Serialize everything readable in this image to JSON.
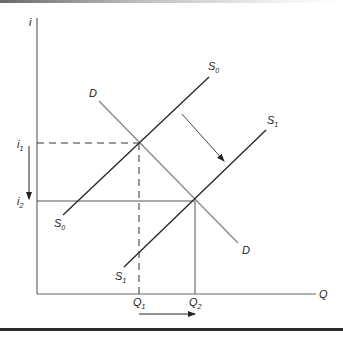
{
  "diagram": {
    "type": "supply-demand",
    "axes": {
      "y_label": "i",
      "x_label": "Q"
    },
    "curves": [
      {
        "name": "S0",
        "label": "S",
        "sub": "0",
        "kind": "supply"
      },
      {
        "name": "S1",
        "label": "S",
        "sub": "1",
        "kind": "supply"
      },
      {
        "name": "D",
        "label": "D",
        "kind": "demand"
      }
    ],
    "levels": {
      "i1": {
        "label": "i",
        "sub": "1"
      },
      "i2": {
        "label": "i",
        "sub": "2"
      },
      "Q1": {
        "label": "Q",
        "sub": "1"
      },
      "Q2": {
        "label": "Q",
        "sub": "2"
      }
    },
    "annotations": [
      "arrow: supply shifts right/down from S0 to S1",
      "arrow: interest rate falls from i1 to i2",
      "arrow: quantity rises from Q1 to Q2"
    ]
  },
  "colors": {
    "supply": "#2a2a2a",
    "demand": "#8a8a8a",
    "axis": "#555555",
    "bottom_border": "#2b2b2b"
  }
}
